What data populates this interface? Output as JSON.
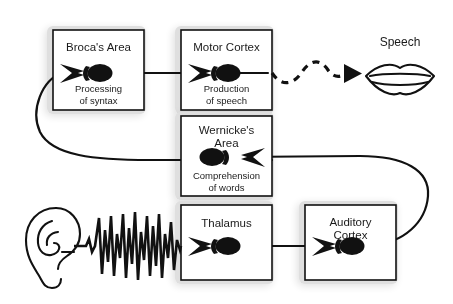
{
  "diagram": {
    "background_color": "#ffffff",
    "line_color": "#111111",
    "box_fill": "#ffffff"
  },
  "nodes": [
    {
      "id": "brocas-area",
      "title": "Broca's Area",
      "subtitle_line1": "Processing",
      "subtitle_line2": "of syntax",
      "x": 53,
      "y": 30,
      "w": 91,
      "h": 80,
      "neuron_direction": "right"
    },
    {
      "id": "motor-cortex",
      "title": "Motor Cortex",
      "subtitle_line1": "Production",
      "subtitle_line2": "of speech",
      "x": 181,
      "y": 30,
      "w": 91,
      "h": 80,
      "neuron_direction": "right"
    },
    {
      "id": "wernickes-area",
      "title_line1": "Wernicke's",
      "title_line2": "Area",
      "subtitle_line1": "Comprehension",
      "subtitle_line2": "of words",
      "x": 181,
      "y": 116,
      "w": 91,
      "h": 80,
      "neuron_direction": "left"
    },
    {
      "id": "thalamus",
      "title": "Thalamus",
      "x": 181,
      "y": 205,
      "w": 91,
      "h": 75,
      "neuron_direction": "right"
    },
    {
      "id": "auditory-cortex",
      "title_line1": "Auditory",
      "title_line2": "Cortex",
      "x": 305,
      "y": 205,
      "w": 91,
      "h": 75,
      "neuron_direction": "right"
    }
  ],
  "labels": {
    "speech": "Speech"
  },
  "icons": {
    "mouth": "mouth-icon",
    "ear": "ear-icon",
    "sound_wave": "sound-wave-icon",
    "dashed_arrow": "dashed-arrow-icon"
  },
  "connections": [
    {
      "id": "brocas-to-motor",
      "from": "brocas-area",
      "to": "motor-cortex",
      "style": "solid"
    },
    {
      "id": "motor-to-speech",
      "from": "motor-cortex",
      "to": "speech",
      "style": "dashed-wavy"
    },
    {
      "id": "wernickes-to-brocas",
      "from": "wernickes-area",
      "to": "brocas-area",
      "style": "solid-loop-left"
    },
    {
      "id": "auditory-to-wernickes",
      "from": "auditory-cortex",
      "to": "wernickes-area",
      "style": "solid-loop-right"
    },
    {
      "id": "ear-to-thalamus",
      "from": "ear",
      "to": "thalamus",
      "style": "sound-wave"
    },
    {
      "id": "thalamus-to-auditory",
      "from": "thalamus",
      "to": "auditory-cortex",
      "style": "solid"
    }
  ]
}
